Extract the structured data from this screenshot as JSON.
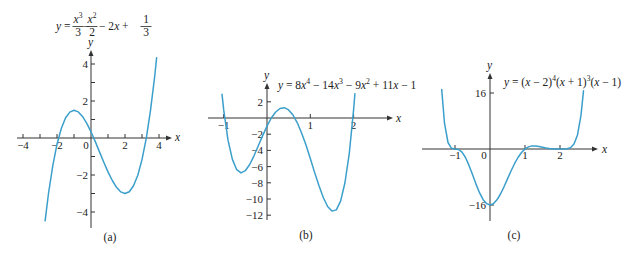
{
  "colors": {
    "curve": "#3b9fcb",
    "axis": "#333333",
    "text": "#222222",
    "background": "#ffffff"
  },
  "chart_data": [
    {
      "id": "a",
      "type": "line",
      "caption": "(a)",
      "title": "y = x³/3 − x²/2 − 2x + 1/3",
      "equation": {
        "lhs": [
          {
            "v": "y",
            "it": 1
          },
          {
            "v": " ="
          }
        ],
        "parts": [
          {
            "frac": {
              "num": [
                {
                  "v": "x",
                  "it": 1
                },
                {
                  "v": "3",
                  "sup": 1
                }
              ],
              "den": "3"
            }
          },
          {
            "text": [
              {
                "v": "−"
              }
            ]
          },
          {
            "frac": {
              "num": [
                {
                  "v": "x",
                  "it": 1
                },
                {
                  "v": "2",
                  "sup": 1
                }
              ],
              "den": "2"
            }
          },
          {
            "text": [
              {
                "v": "− 2"
              },
              {
                "v": "x",
                "it": 1
              },
              {
                "v": " +"
              }
            ]
          },
          {
            "frac": {
              "num": [
                {
                  "v": "1"
                }
              ],
              "den": "3"
            }
          }
        ]
      },
      "xlabel": "x",
      "ylabel": "y",
      "xlim": [
        -4.4,
        4.8
      ],
      "ylim": [
        -4.9,
        4.8
      ],
      "grid": false,
      "xticks": [
        -4,
        -3,
        -2,
        -1,
        1,
        2,
        3,
        4
      ],
      "xtick_labels": [
        {
          "at": -4,
          "label": "−4"
        },
        {
          "at": -2,
          "label": "−2"
        },
        {
          "at": 0,
          "label": "0"
        },
        {
          "at": 2,
          "label": "2"
        },
        {
          "at": 4,
          "label": "4"
        }
      ],
      "yticks": [
        -4,
        -3,
        -2,
        -1,
        1,
        2,
        3,
        4
      ],
      "ytick_labels": [
        {
          "at": 4,
          "label": "4"
        },
        {
          "at": 2,
          "label": "2"
        },
        {
          "at": -2,
          "label": "−2"
        },
        {
          "at": -4,
          "label": "−4"
        }
      ],
      "series": [
        {
          "name": "y = x³/3 − x²/2 − 2x + 1/3",
          "x": [
            -2.7,
            -2.5,
            -2.25,
            -2,
            -1.75,
            -1.5,
            -1.25,
            -1,
            -0.75,
            -0.5,
            -0.25,
            0,
            0.25,
            0.5,
            0.75,
            1,
            1.25,
            1.5,
            1.75,
            2,
            2.25,
            2.5,
            2.75,
            3,
            3.25,
            3.5,
            3.75,
            3.86
          ],
          "y": [
            -4.473,
            -3.0,
            -1.495,
            -0.333,
            0.516,
            1.083,
            1.401,
            1.5,
            1.411,
            1.167,
            0.797,
            0.333,
            -0.193,
            -0.75,
            -1.307,
            -1.833,
            -2.297,
            -2.667,
            -2.912,
            -3.0,
            -2.901,
            -2.583,
            -2.016,
            -1.167,
            -0.005,
            1.5,
            3.38,
            4.333
          ]
        }
      ]
    },
    {
      "id": "b",
      "type": "line",
      "caption": "(b)",
      "title": "y = 8x⁴ − 14x³ − 9x² + 11x − 1",
      "equation_tokens": [
        {
          "v": "y",
          "it": 1
        },
        {
          "v": " = 8"
        },
        {
          "v": "x",
          "it": 1
        },
        {
          "v": "4",
          "sup": 1
        },
        {
          "v": " − 14"
        },
        {
          "v": "x",
          "it": 1
        },
        {
          "v": "3",
          "sup": 1
        },
        {
          "v": " − 9"
        },
        {
          "v": "x",
          "it": 1
        },
        {
          "v": "2",
          "sup": 1
        },
        {
          "v": " + 11"
        },
        {
          "v": "x",
          "it": 1
        },
        {
          "v": " − 1"
        }
      ],
      "xlabel": "x",
      "ylabel": "y",
      "xlim": [
        -1.4,
        2.9
      ],
      "ylim": [
        -12.6,
        4.4
      ],
      "grid": false,
      "xticks": [
        -1,
        1,
        2
      ],
      "xtick_labels": [
        {
          "at": -1,
          "label": "−1"
        },
        {
          "at": 1,
          "label": "1"
        },
        {
          "at": 2,
          "label": "2"
        }
      ],
      "yticks": [
        2,
        -2,
        -4,
        -6,
        -8,
        -10,
        -12
      ],
      "ytick_labels": [
        {
          "at": 2,
          "label": "2"
        },
        {
          "at": -2,
          "label": "−2"
        },
        {
          "at": -4,
          "label": "−4"
        },
        {
          "at": -6,
          "label": "−6"
        },
        {
          "at": -8,
          "label": "−8"
        },
        {
          "at": -10,
          "label": "−10"
        },
        {
          "at": -12,
          "label": "−12"
        }
      ],
      "series": [
        {
          "name": "y = 8x⁴ − 14x³ − 9x² + 11x − 1",
          "x": [
            -1.04,
            -1.0,
            -0.9,
            -0.8,
            -0.7,
            -0.6,
            -0.5,
            -0.4,
            -0.3,
            -0.2,
            -0.1,
            0,
            0.1,
            0.2,
            0.3,
            0.4,
            0.5,
            0.6,
            0.7,
            0.8,
            0.9,
            1.0,
            1.1,
            1.2,
            1.3,
            1.4,
            1.5,
            1.6,
            1.7,
            1.8,
            1.9,
            2.0,
            2.03
          ],
          "y": [
            2.933,
            1.0,
            -2.735,
            -5.115,
            -6.387,
            -6.779,
            -6.5,
            -5.739,
            -4.667,
            -3.435,
            -2.175,
            -1.0,
            -0.003,
            0.741,
            1.177,
            1.269,
            1.0,
            0.373,
            -0.591,
            -1.851,
            -3.347,
            -5.0,
            -6.711,
            -8.363,
            -9.819,
            -10.923,
            -11.5,
            -11.35,
            -10.275,
            -8.027,
            -4.359,
            1.0,
            3.0
          ]
        }
      ]
    },
    {
      "id": "c",
      "type": "line",
      "caption": "(c)",
      "title": "y = (x − 2)⁴(x + 1)³(x − 1)",
      "equation_tokens": [
        {
          "v": "y",
          "it": 1
        },
        {
          "v": " = ("
        },
        {
          "v": "x",
          "it": 1
        },
        {
          "v": " − 2)"
        },
        {
          "v": "4",
          "sup": 1
        },
        {
          "v": "("
        },
        {
          "v": "x",
          "it": 1
        },
        {
          "v": " + 1)"
        },
        {
          "v": "3",
          "sup": 1
        },
        {
          "v": "("
        },
        {
          "v": "x",
          "it": 1
        },
        {
          "v": " − 1)"
        }
      ],
      "xlabel": "x",
      "ylabel": "y",
      "xlim": [
        -1.95,
        3.1
      ],
      "ylim": [
        -20.6,
        21.7
      ],
      "grid": false,
      "xticks": [
        -1,
        1,
        2
      ],
      "xtick_labels": [
        {
          "at": -1,
          "label": "−1"
        },
        {
          "at": 0,
          "label": "0"
        },
        {
          "at": 1,
          "label": "1"
        },
        {
          "at": 2,
          "label": "2"
        }
      ],
      "yticks": [
        16,
        -16
      ],
      "ytick_labels": [
        {
          "at": 16,
          "label": "16"
        },
        {
          "at": -16,
          "label": "−16"
        }
      ],
      "series": [
        {
          "name": "y = (x − 2)⁴(x + 1)³(x − 1)",
          "x": [
            -1.38,
            -1.3,
            -1.2,
            -1.1,
            -1.0,
            -0.9,
            -0.8,
            -0.7,
            -0.6,
            -0.5,
            -0.4,
            -0.3,
            -0.2,
            -0.1,
            0,
            0.1,
            0.2,
            0.3,
            0.4,
            0.5,
            0.6,
            0.7,
            0.8,
            0.9,
            1.0,
            1.1,
            1.2,
            1.3,
            1.4,
            1.5,
            1.6,
            1.7,
            1.8,
            1.9,
            2.0,
            2.1,
            2.2,
            2.3,
            2.4,
            2.5,
            2.6,
            2.67
          ],
          "y": [
            17.04,
            7.36,
            1.845,
            0.194,
            0,
            -0.134,
            -0.885,
            -2.439,
            -4.68,
            -7.32,
            -10.03,
            -12.48,
            -14.39,
            -15.6,
            -16,
            -15.61,
            -14.51,
            -12.85,
            -10.79,
            -8.54,
            -6.29,
            -4.21,
            -2.42,
            -1.004,
            0,
            0.608,
            0.872,
            0.876,
            0.717,
            0.488,
            0.27,
            0.112,
            0.028,
            0.002,
            0,
            0.003,
            0.063,
            0.378,
            1.409,
            4.02,
            9.67,
            16.63
          ]
        }
      ]
    }
  ]
}
